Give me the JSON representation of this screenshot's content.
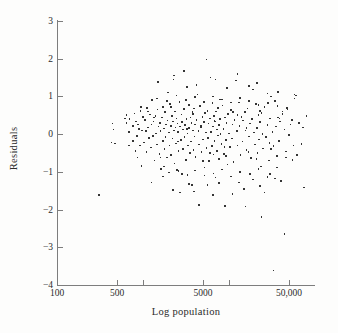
{
  "chart_data": {
    "type": "scatter",
    "title": "",
    "xlabel": "Log population",
    "ylabel": "Residuals",
    "x_scale": "log",
    "xlim": [
      100,
      100000
    ],
    "ylim": [
      -4,
      3
    ],
    "grid": false,
    "legend": null,
    "x_ticks": [
      {
        "value": 100,
        "label": "100"
      },
      {
        "value": 500,
        "label": "500"
      },
      {
        "value": 1000,
        "label": ""
      },
      {
        "value": 5000,
        "label": "5000"
      },
      {
        "value": 10000,
        "label": ""
      },
      {
        "value": 50000,
        "label": "50,000"
      }
    ],
    "y_ticks": [
      {
        "value": 3,
        "label": "3"
      },
      {
        "value": 2,
        "label": "2"
      },
      {
        "value": 1,
        "label": "1"
      },
      {
        "value": 0,
        "label": "0"
      },
      {
        "value": -1,
        "label": "−1"
      },
      {
        "value": -2,
        "label": "−2"
      },
      {
        "value": -3,
        "label": "−3"
      },
      {
        "value": -4,
        "label": "−4"
      }
    ],
    "marker": {
      "shape": "square",
      "size_px": 1.6,
      "color": "#343434"
    },
    "axis_color": "#7d7d7d",
    "background": "#fdfdfc",
    "n_points": 300,
    "points": [
      [
        440,
        0.28
      ],
      [
        455,
        0.12
      ],
      [
        470,
        -0.25
      ],
      [
        620,
        0.42
      ],
      [
        640,
        0.3
      ],
      [
        700,
        0.4
      ],
      [
        690,
        0.05
      ],
      [
        760,
        0.22
      ],
      [
        770,
        -0.18
      ],
      [
        800,
        0.55
      ],
      [
        830,
        0.34
      ],
      [
        850,
        -0.05
      ],
      [
        860,
        -0.62
      ],
      [
        880,
        0.26
      ],
      [
        900,
        0.14
      ],
      [
        920,
        -0.3
      ],
      [
        940,
        0.62
      ],
      [
        960,
        -0.85
      ],
      [
        980,
        0.1
      ],
      [
        1000,
        0.45
      ],
      [
        1020,
        -0.22
      ],
      [
        1050,
        0.38
      ],
      [
        1080,
        0.08
      ],
      [
        1100,
        -0.48
      ],
      [
        1120,
        0.7
      ],
      [
        1150,
        0.18
      ],
      [
        1180,
        -0.1
      ],
      [
        1200,
        0.52
      ],
      [
        1230,
        -0.35
      ],
      [
        1250,
        0.26
      ],
      [
        1280,
        0.9
      ],
      [
        1300,
        -0.05
      ],
      [
        1330,
        0.33
      ],
      [
        1360,
        -0.7
      ],
      [
        1400,
        0.48
      ],
      [
        1420,
        0.02
      ],
      [
        1450,
        -0.28
      ],
      [
        1480,
        0.65
      ],
      [
        1500,
        1.38
      ],
      [
        1520,
        0.2
      ],
      [
        1550,
        -0.52
      ],
      [
        1580,
        0.3
      ],
      [
        1600,
        0.08
      ],
      [
        1630,
        -0.92
      ],
      [
        1660,
        0.44
      ],
      [
        1700,
        -0.18
      ],
      [
        1720,
        0.72
      ],
      [
        1750,
        0.15
      ],
      [
        1780,
        -0.4
      ],
      [
        1800,
        0.58
      ],
      [
        1830,
        -0.08
      ],
      [
        1860,
        0.26
      ],
      [
        1900,
        -0.62
      ],
      [
        1930,
        0.36
      ],
      [
        1960,
        1.1
      ],
      [
        2000,
        0.04
      ],
      [
        2030,
        -0.3
      ],
      [
        2060,
        0.8
      ],
      [
        2100,
        0.22
      ],
      [
        2130,
        -0.55
      ],
      [
        2160,
        0.48
      ],
      [
        2200,
        -0.12
      ],
      [
        2230,
        0.34
      ],
      [
        2260,
        1.45
      ],
      [
        2300,
        0.1
      ],
      [
        2330,
        -0.78
      ],
      [
        2360,
        0.6
      ],
      [
        2400,
        0.18
      ],
      [
        2430,
        -0.25
      ],
      [
        2460,
        0.42
      ],
      [
        2500,
        -0.95
      ],
      [
        2530,
        0.28
      ],
      [
        2560,
        0.06
      ],
      [
        2600,
        -0.45
      ],
      [
        2650,
        0.86
      ],
      [
        2700,
        0.2
      ],
      [
        2750,
        -0.15
      ],
      [
        2800,
        0.52
      ],
      [
        2830,
        -1.05
      ],
      [
        2860,
        0.32
      ],
      [
        2900,
        0.12
      ],
      [
        2950,
        -0.38
      ],
      [
        3000,
        0.66
      ],
      [
        3050,
        -0.08
      ],
      [
        3100,
        0.24
      ],
      [
        3150,
        -0.68
      ],
      [
        3200,
        0.4
      ],
      [
        3250,
        1.25
      ],
      [
        3300,
        0.02
      ],
      [
        3350,
        -0.3
      ],
      [
        3400,
        0.78
      ],
      [
        3450,
        0.16
      ],
      [
        3500,
        -0.5
      ],
      [
        3550,
        0.44
      ],
      [
        3600,
        -0.2
      ],
      [
        3650,
        0.3
      ],
      [
        3700,
        -1.35
      ],
      [
        3750,
        0.58
      ],
      [
        3800,
        0.1
      ],
      [
        3850,
        -0.42
      ],
      [
        3900,
        0.68
      ],
      [
        3950,
        -0.06
      ],
      [
        4000,
        0.26
      ],
      [
        4100,
        -0.6
      ],
      [
        4200,
        0.38
      ],
      [
        4300,
        1.05
      ],
      [
        4400,
        0.08
      ],
      [
        4500,
        -0.28
      ],
      [
        4600,
        0.74
      ],
      [
        4700,
        0.18
      ],
      [
        4800,
        -0.48
      ],
      [
        4900,
        0.46
      ],
      [
        5000,
        -0.14
      ],
      [
        5100,
        0.32
      ],
      [
        5200,
        -0.88
      ],
      [
        5300,
        0.56
      ],
      [
        5400,
        0.04
      ],
      [
        5500,
        -0.36
      ],
      [
        5600,
        0.62
      ],
      [
        5700,
        -0.1
      ],
      [
        5800,
        0.28
      ],
      [
        5900,
        -0.72
      ],
      [
        6000,
        0.42
      ],
      [
        6100,
        1.5
      ],
      [
        6200,
        0.06
      ],
      [
        6300,
        -0.32
      ],
      [
        6400,
        0.82
      ],
      [
        6500,
        0.2
      ],
      [
        6600,
        -0.54
      ],
      [
        6700,
        0.48
      ],
      [
        6800,
        -0.18
      ],
      [
        6900,
        0.34
      ],
      [
        7000,
        -1.15
      ],
      [
        7100,
        0.6
      ],
      [
        7200,
        0.12
      ],
      [
        7300,
        -0.44
      ],
      [
        7400,
        0.7
      ],
      [
        7500,
        -0.04
      ],
      [
        7600,
        0.24
      ],
      [
        7700,
        -0.66
      ],
      [
        7800,
        0.4
      ],
      [
        7900,
        0.92
      ],
      [
        8000,
        0.0
      ],
      [
        8200,
        -0.26
      ],
      [
        8400,
        0.76
      ],
      [
        8600,
        0.14
      ],
      [
        8800,
        -0.52
      ],
      [
        9000,
        0.44
      ],
      [
        9200,
        -0.16
      ],
      [
        9400,
        0.3
      ],
      [
        9600,
        -0.8
      ],
      [
        9800,
        0.54
      ],
      [
        10000,
        0.02
      ],
      [
        10200,
        -0.34
      ],
      [
        10500,
        0.64
      ],
      [
        10800,
        -0.12
      ],
      [
        11000,
        0.26
      ],
      [
        11300,
        -0.74
      ],
      [
        11600,
        0.38
      ],
      [
        12000,
        1.42
      ],
      [
        12300,
        0.08
      ],
      [
        12600,
        -0.3
      ],
      [
        13000,
        0.84
      ],
      [
        13300,
        0.22
      ],
      [
        13600,
        -0.56
      ],
      [
        14000,
        0.46
      ],
      [
        14300,
        -0.2
      ],
      [
        14600,
        0.36
      ],
      [
        15000,
        -1.45
      ],
      [
        15300,
        0.58
      ],
      [
        15600,
        0.1
      ],
      [
        16000,
        -0.42
      ],
      [
        16500,
        0.68
      ],
      [
        17000,
        -0.06
      ],
      [
        17500,
        0.28
      ],
      [
        18000,
        -0.64
      ],
      [
        18500,
        0.4
      ],
      [
        19000,
        1.18
      ],
      [
        19500,
        0.04
      ],
      [
        20000,
        -0.28
      ],
      [
        20500,
        0.8
      ],
      [
        21000,
        0.16
      ],
      [
        21500,
        -0.5
      ],
      [
        22000,
        0.5
      ],
      [
        22500,
        -0.14
      ],
      [
        23000,
        0.32
      ],
      [
        23500,
        -0.86
      ],
      [
        24000,
        0.56
      ],
      [
        24500,
        0.0
      ],
      [
        25000,
        -0.38
      ],
      [
        26000,
        0.72
      ],
      [
        27000,
        -0.08
      ],
      [
        28000,
        0.24
      ],
      [
        29000,
        -0.7
      ],
      [
        30000,
        0.42
      ],
      [
        31000,
        1.0
      ],
      [
        32000,
        0.06
      ],
      [
        33000,
        -0.32
      ],
      [
        34000,
        0.88
      ],
      [
        35000,
        0.2
      ],
      [
        36000,
        -0.58
      ],
      [
        37000,
        0.44
      ],
      [
        38000,
        -0.18
      ],
      [
        39000,
        0.34
      ],
      [
        40000,
        -1.25
      ],
      [
        42000,
        0.6
      ],
      [
        44000,
        0.12
      ],
      [
        46000,
        -0.46
      ],
      [
        48000,
        0.66
      ],
      [
        50000,
        -0.02
      ],
      [
        52000,
        0.26
      ],
      [
        55000,
        -0.68
      ],
      [
        58000,
        0.95
      ],
      [
        60000,
        1.02
      ],
      [
        65000,
        0.3
      ],
      [
        70000,
        -0.26
      ],
      [
        75000,
        -1.42
      ],
      [
        80000,
        0.48
      ],
      [
        430,
        -0.22
      ],
      [
        310,
        -1.62
      ],
      [
        1250,
        -1.28
      ],
      [
        2250,
        -1.48
      ],
      [
        2700,
        -1.55
      ],
      [
        3450,
        -1.32
      ],
      [
        3900,
        -1.52
      ],
      [
        4500,
        -1.88
      ],
      [
        5600,
        -1.35
      ],
      [
        6500,
        -1.62
      ],
      [
        7600,
        -1.3
      ],
      [
        9000,
        -1.9
      ],
      [
        11000,
        -1.58
      ],
      [
        13000,
        -1.28
      ],
      [
        15500,
        -1.92
      ],
      [
        19000,
        -1.2
      ],
      [
        23000,
        -1.38
      ],
      [
        26000,
        -1.55
      ],
      [
        30000,
        -1.05
      ],
      [
        34000,
        -1.18
      ],
      [
        24000,
        -2.2
      ],
      [
        44000,
        -2.65
      ],
      [
        33000,
        -3.62
      ],
      [
        2300,
        1.55
      ],
      [
        3000,
        1.68
      ],
      [
        4200,
        1.3
      ],
      [
        5500,
        1.98
      ],
      [
        7000,
        1.45
      ],
      [
        9500,
        1.22
      ],
      [
        12500,
        1.6
      ],
      [
        17000,
        1.28
      ],
      [
        21000,
        1.35
      ],
      [
        28000,
        1.08
      ],
      [
        37000,
        1.12
      ],
      [
        58000,
        1.05
      ],
      [
        1700,
        -1.12
      ],
      [
        2000,
        -1.02
      ],
      [
        2600,
        -0.98
      ],
      [
        3300,
        -1.08
      ],
      [
        4000,
        -0.96
      ],
      [
        5200,
        -1.1
      ],
      [
        6600,
        -1.04
      ],
      [
        8300,
        -0.94
      ],
      [
        10500,
        -1.12
      ],
      [
        13500,
        -1.0
      ],
      [
        17500,
        -1.06
      ],
      [
        22000,
        -0.92
      ],
      [
        28000,
        -1.14
      ],
      [
        36000,
        -0.88
      ],
      [
        46000,
        -0.62
      ],
      [
        1450,
        0.95
      ],
      [
        1900,
        0.88
      ],
      [
        2450,
        1.02
      ],
      [
        3150,
        0.9
      ],
      [
        4050,
        0.98
      ],
      [
        5150,
        0.86
      ],
      [
        6550,
        1.0
      ],
      [
        8300,
        0.92
      ],
      [
        10600,
        0.84
      ],
      [
        13500,
        0.96
      ],
      [
        17200,
        0.88
      ],
      [
        22000,
        0.78
      ],
      [
        28500,
        0.82
      ],
      [
        36500,
        0.74
      ],
      [
        47000,
        0.7
      ],
      [
        820,
        -0.44
      ],
      [
        1150,
        0.6
      ],
      [
        1600,
        -0.62
      ],
      [
        2100,
        0.72
      ],
      [
        2900,
        -0.4
      ],
      [
        3800,
        0.54
      ],
      [
        5000,
        -0.72
      ],
      [
        6800,
        0.36
      ],
      [
        9200,
        -0.58
      ],
      [
        12500,
        0.5
      ],
      [
        16800,
        -0.48
      ],
      [
        23000,
        0.62
      ],
      [
        31000,
        -0.4
      ],
      [
        42000,
        0.54
      ],
      [
        56000,
        -0.3
      ],
      [
        640,
        0.5
      ],
      [
        690,
        -0.3
      ],
      [
        1350,
        0.44
      ],
      [
        2550,
        -0.2
      ],
      [
        4750,
        0.22
      ],
      [
        8900,
        -0.34
      ],
      [
        16000,
        0.16
      ],
      [
        29500,
        -0.24
      ],
      [
        54000,
        0.38
      ],
      [
        72000,
        0.18
      ],
      [
        950,
        0.72
      ],
      [
        1750,
        -0.86
      ],
      [
        3250,
        0.14
      ],
      [
        6050,
        -0.5
      ],
      [
        11200,
        0.58
      ],
      [
        20800,
        -0.66
      ],
      [
        38500,
        0.42
      ],
      [
        62000,
        -0.56
      ]
    ]
  },
  "figure": {
    "xlabel_text": "Log population",
    "ylabel_text": "Residuals"
  }
}
